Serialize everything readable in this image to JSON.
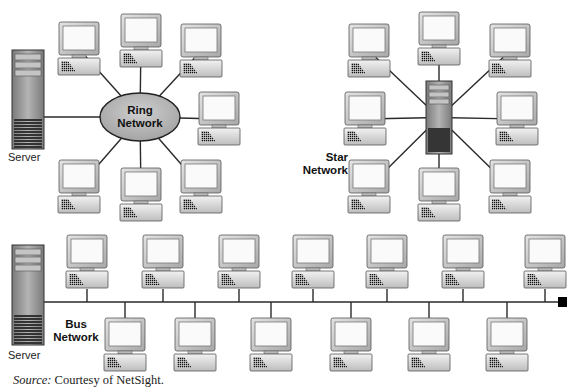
{
  "figure": {
    "colors": {
      "line": "#2a2a2a",
      "ring_fill": "#b8b8b8",
      "monitor_frame": "#c8c8c8",
      "monitor_screen": "#fafafa",
      "server_body": "#9a9a9a",
      "server_dark": "#3a3a3a",
      "terminator": "#000000"
    }
  },
  "ring": {
    "label_line1": "Ring",
    "label_line2": "Network",
    "server_label": "Server",
    "center": [
      140,
      117
    ],
    "computers": [
      [
        58,
        22
      ],
      [
        120,
        14
      ],
      [
        180,
        24
      ],
      [
        198,
        92
      ],
      [
        58,
        160
      ],
      [
        120,
        168
      ],
      [
        180,
        160
      ]
    ]
  },
  "star": {
    "label_line1": "Star",
    "label_line2": "Network",
    "hub": [
      426,
      81,
      26,
      73
    ],
    "computers": [
      [
        348,
        24
      ],
      [
        418,
        12
      ],
      [
        489,
        24
      ],
      [
        344,
        92
      ],
      [
        496,
        92
      ],
      [
        348,
        160
      ],
      [
        418,
        168
      ],
      [
        489,
        160
      ]
    ]
  },
  "bus": {
    "label_line1": "Bus",
    "label_line2": "Network",
    "server_label": "Server",
    "line_y": 302,
    "top_computers": [
      66,
      142,
      218,
      292,
      366,
      442,
      524
    ],
    "bottom_computers": [
      104,
      174,
      250,
      330,
      408,
      486
    ]
  },
  "caption": {
    "source_label": "Source:",
    "source_text": " Courtesy of NetSight."
  }
}
